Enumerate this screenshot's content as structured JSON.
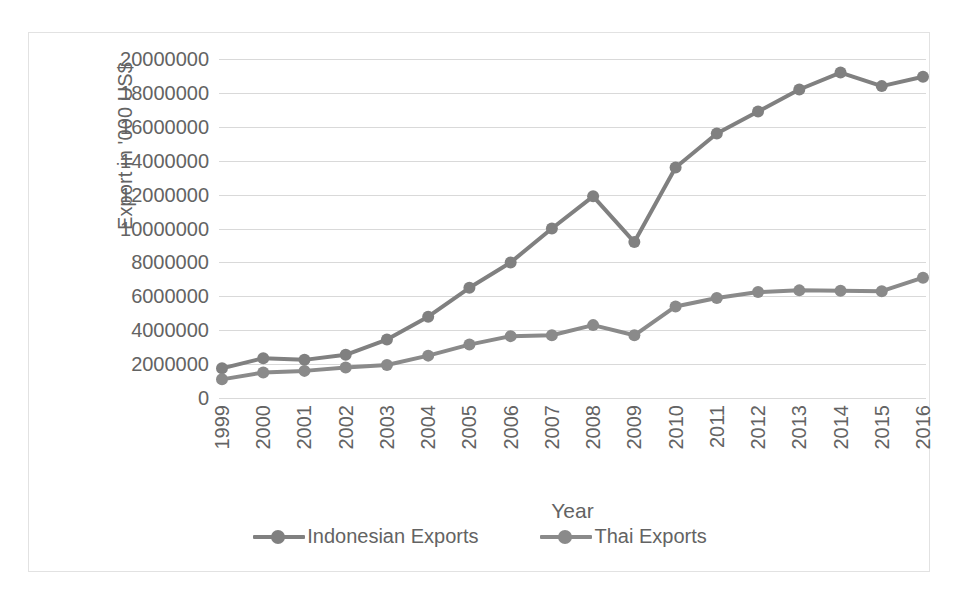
{
  "chart_data": {
    "type": "line",
    "title": "",
    "xlabel": "Year",
    "ylabel": "Export in '000 US$",
    "categories": [
      1999,
      2000,
      2001,
      2002,
      2003,
      2004,
      2005,
      2006,
      2007,
      2008,
      2009,
      2010,
      2011,
      2012,
      2013,
      2014,
      2015,
      2016
    ],
    "x_tick_labels": [
      "1999",
      "2000",
      "2001",
      "2002",
      "2003",
      "2004",
      "2005",
      "2006",
      "2007",
      "2008",
      "2009",
      "2010",
      "2011",
      "2012",
      "2013",
      "2014",
      "2015",
      "2016"
    ],
    "y_tick_labels": [
      "20000000",
      "18000000",
      "16000000",
      "14000000",
      "12000000",
      "10000000",
      "8000000",
      "6000000",
      "4000000",
      "2000000",
      "0"
    ],
    "y_tick_values": [
      20000000,
      18000000,
      16000000,
      14000000,
      12000000,
      10000000,
      8000000,
      6000000,
      4000000,
      2000000,
      0
    ],
    "ylim": [
      0,
      20000000
    ],
    "grid": true,
    "legend_position": "bottom",
    "series": [
      {
        "name": "Indonesian Exports",
        "color": "#808080",
        "values": [
          1750000,
          2350000,
          2250000,
          2550000,
          3450000,
          4800000,
          6500000,
          8000000,
          10000000,
          11900000,
          9200000,
          13600000,
          15600000,
          16900000,
          18200000,
          19200000,
          18400000,
          18950000
        ]
      },
      {
        "name": "Thai Exports",
        "color": "#8a8a8a",
        "values": [
          1100000,
          1500000,
          1600000,
          1800000,
          1950000,
          2500000,
          3150000,
          3650000,
          3700000,
          4300000,
          3700000,
          5400000,
          5900000,
          6250000,
          6350000,
          6330000,
          6300000,
          7100000
        ]
      }
    ]
  },
  "style": {
    "gridline_color": "#d9d9d9",
    "text_color": "#636363",
    "frame_border_color": "#e2e2e2",
    "background": "#ffffff"
  }
}
